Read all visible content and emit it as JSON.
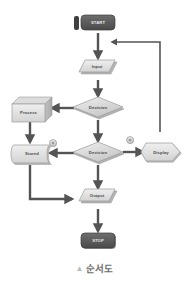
{
  "diagram": {
    "type": "flowchart",
    "background_color": "#ffffff",
    "line_color": "#545454",
    "shape_fill_light": "#e3e3e3",
    "shape_fill_mid": "#cfcfcf",
    "shape_fill_dark": "#5a5a5a",
    "shape_stroke": "#9a9a9a",
    "label_color": "#4a4a4a",
    "label_color_light": "#e8e8e8",
    "nodes": [
      {
        "id": "start",
        "label": "START",
        "shape": "terminator",
        "x": 98,
        "y": 25
      },
      {
        "id": "input",
        "label": "Input",
        "shape": "parallelogram",
        "x": 98,
        "y": 70
      },
      {
        "id": "decision1",
        "label": "Decision",
        "shape": "diamond",
        "x": 98,
        "y": 108
      },
      {
        "id": "process",
        "label": "Process",
        "shape": "process-3d",
        "x": 32,
        "y": 108
      },
      {
        "id": "stored",
        "label": "Stored",
        "shape": "stored-data",
        "x": 32,
        "y": 153
      },
      {
        "id": "decision2",
        "label": "Decision",
        "shape": "diamond",
        "x": 98,
        "y": 153
      },
      {
        "id": "display",
        "label": "Display",
        "shape": "display",
        "x": 160,
        "y": 150
      },
      {
        "id": "output",
        "label": "Output",
        "shape": "parallelogram",
        "x": 98,
        "y": 198
      },
      {
        "id": "stop",
        "label": "STOP",
        "shape": "terminator",
        "x": 98,
        "y": 240
      }
    ],
    "connectors": [
      {
        "id": "conn-left",
        "label": "connector-circle-left",
        "x": 53,
        "y": 143
      },
      {
        "id": "conn-right",
        "label": "connector-circle-right",
        "x": 130,
        "y": 140
      }
    ],
    "edges": [
      {
        "id": "e-start-input",
        "from": "start",
        "to": "input",
        "kind": "arrow-down"
      },
      {
        "id": "e-input-decision1",
        "from": "input",
        "to": "decision1",
        "kind": "arrow-down"
      },
      {
        "id": "e-decision1-process",
        "from": "decision1",
        "to": "process",
        "kind": "arrow-left"
      },
      {
        "id": "e-decision1-decision2",
        "from": "decision1",
        "to": "decision2",
        "kind": "arrow-down"
      },
      {
        "id": "e-process-stored",
        "from": "process",
        "to": "stored",
        "kind": "arrow-down"
      },
      {
        "id": "e-decision2-stored",
        "from": "decision2",
        "to": "stored",
        "kind": "arrow-left"
      },
      {
        "id": "e-decision2-display",
        "from": "decision2",
        "to": "display",
        "kind": "arrow-right"
      },
      {
        "id": "e-decision2-output",
        "from": "decision2",
        "to": "output",
        "kind": "arrow-down"
      },
      {
        "id": "e-stored-output",
        "from": "stored",
        "to": "output",
        "kind": "elbow-arrow-right"
      },
      {
        "id": "e-output-stop",
        "from": "output",
        "to": "stop",
        "kind": "arrow-down"
      },
      {
        "id": "e-display-input",
        "from": "display",
        "to": "input",
        "kind": "feedback-loop-left"
      }
    ]
  },
  "caption": {
    "marker": "▲",
    "text": "순서도"
  }
}
